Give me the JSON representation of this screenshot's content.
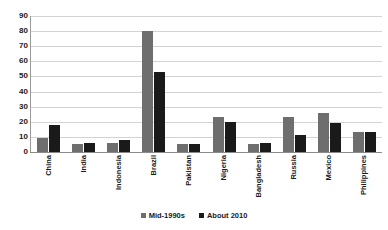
{
  "chart_data": {
    "type": "bar",
    "title": "",
    "subtitle": "",
    "xlabel": "",
    "ylabel": "",
    "ylim": [
      0,
      90
    ],
    "ytick_step": 10,
    "yticks": [
      90,
      80,
      70,
      60,
      50,
      40,
      30,
      20,
      10,
      0
    ],
    "grid": true,
    "legend_position": "bottom",
    "categories": [
      "China",
      "India",
      "Indonesia",
      "Brazil",
      "Pakistan",
      "Nigeria",
      "Bangladesh",
      "Russia",
      "Mexico",
      "Philippines"
    ],
    "series": [
      {
        "name": "Mid-1990s",
        "color": "#6e6e6e",
        "values": [
          9,
          5,
          6,
          80,
          5,
          23,
          5,
          23,
          26,
          13
        ]
      },
      {
        "name": "About 2010",
        "color": "#1a1a1a",
        "values": [
          18,
          6,
          8,
          53,
          5,
          20,
          6,
          11,
          19,
          13
        ]
      }
    ]
  },
  "colors": {
    "background": "#ffffff",
    "gridline": "#d3d3d3",
    "axis": "#8a8a8a",
    "text": "#1a1a1a",
    "series_mid_1990s": "#6e6e6e",
    "series_about_2010": "#1a1a1a"
  }
}
